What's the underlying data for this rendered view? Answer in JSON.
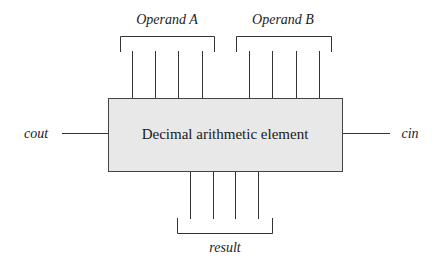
{
  "diagram": {
    "element": {
      "label": "Decimal arithmetic element",
      "fill": "#e8e8e8",
      "stroke": "#444444"
    },
    "inputs": {
      "operand_a": {
        "label": "Operand A",
        "bits": 4
      },
      "operand_b": {
        "label": "Operand B",
        "bits": 4
      },
      "cin": {
        "label": "cin"
      }
    },
    "outputs": {
      "result": {
        "label": "result",
        "bits": 4
      },
      "cout": {
        "label": "cout"
      }
    }
  }
}
